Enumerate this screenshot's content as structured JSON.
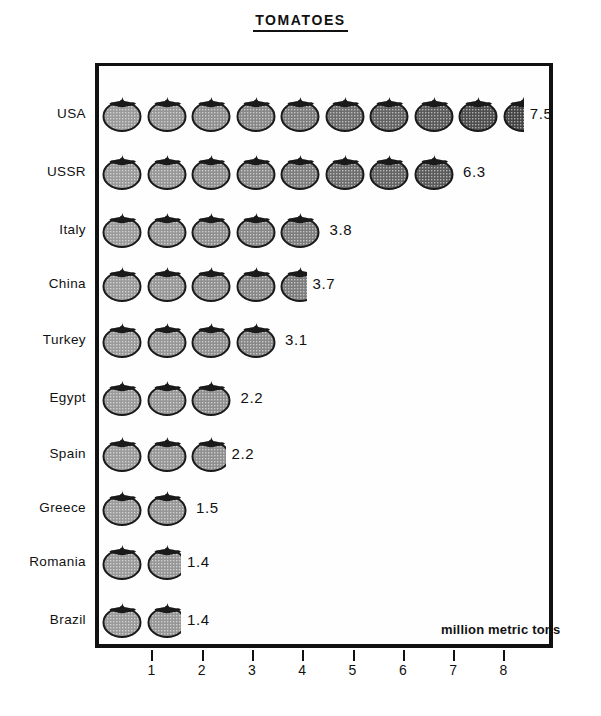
{
  "chart_title": "TOMATOES",
  "units_label": "million metric tons",
  "axis": {
    "ticks": [
      "1",
      "2",
      "3",
      "4",
      "5",
      "6",
      "7",
      "8"
    ],
    "min": 0,
    "max": 8
  },
  "icon": {
    "name": "tomato-icon",
    "unit_value": 0.75,
    "body_color": "#8e8e8e",
    "outline_color": "#1a1a1a",
    "stem_color": "#1a1a1a"
  },
  "chart_data": {
    "type": "bar",
    "subtype": "pictogram",
    "title": "TOMATOES",
    "xlabel": "million metric tons",
    "ylabel": "",
    "xlim": [
      0,
      8
    ],
    "grid": false,
    "legend": "none",
    "categories": [
      "USA",
      "USSR",
      "Italy",
      "China",
      "Turkey",
      "Egypt",
      "Spain",
      "Greece",
      "Romania",
      "Brazil"
    ],
    "values": [
      7.5,
      6.3,
      3.8,
      3.7,
      3.1,
      2.2,
      2.2,
      1.5,
      1.4,
      1.4
    ],
    "value_labels": [
      "7.5",
      "6.3",
      "3.8",
      "3.7",
      "3.1",
      "2.2",
      "2.2",
      "1.5",
      "1.4",
      "1.4"
    ],
    "icon_counts": [
      9.5,
      8,
      5,
      4.6,
      4,
      3,
      3,
      2,
      1.8,
      1.8
    ]
  },
  "rows": [
    {
      "label": "USA",
      "value": "7.5",
      "icons_full": 9,
      "icons_partial": 0.5,
      "top": 88
    },
    {
      "label": "USSR",
      "value": "6.3",
      "icons_full": 8,
      "icons_partial": 0,
      "top": 146
    },
    {
      "label": "Italy",
      "value": "3.8",
      "icons_full": 5,
      "icons_partial": 0,
      "top": 204
    },
    {
      "label": "China",
      "value": "3.7",
      "icons_full": 4,
      "icons_partial": 0.62,
      "top": 258
    },
    {
      "label": "Turkey",
      "value": "3.1",
      "icons_full": 4,
      "icons_partial": 0,
      "top": 314
    },
    {
      "label": "Egypt",
      "value": "2.2",
      "icons_full": 3,
      "icons_partial": 0,
      "top": 372
    },
    {
      "label": "Spain",
      "value": "2.2",
      "icons_full": 2,
      "icons_partial": 0.8,
      "top": 428
    },
    {
      "label": "Greece",
      "value": "1.5",
      "icons_full": 2,
      "icons_partial": 0,
      "top": 482
    },
    {
      "label": "Romania",
      "value": "1.4",
      "icons_full": 1,
      "icons_partial": 0.8,
      "top": 536
    },
    {
      "label": "Brazil",
      "value": "1.4",
      "icons_full": 1,
      "icons_partial": 0.8,
      "top": 594
    }
  ]
}
